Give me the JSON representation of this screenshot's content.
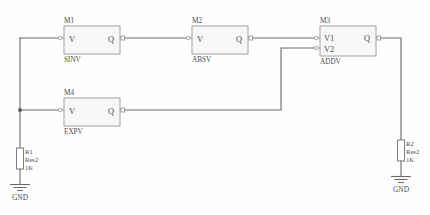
{
  "canvas": {
    "width": 430,
    "height": 215,
    "background": "#fefefe",
    "wire_color": "#6b6b6b",
    "block_fill": "#f7f7f7",
    "block_stroke": "#9a9a9a",
    "text_color": "#4a4a4a",
    "title": "Behavioral function block schematic"
  },
  "blocks": [
    {
      "id": "m1",
      "ref": "M1",
      "type": "SINV",
      "inputs": [
        "V"
      ],
      "output": "Q",
      "x": 64,
      "y": 26,
      "width": 56,
      "height": 28
    },
    {
      "id": "m2",
      "ref": "M2",
      "type": "ABSV",
      "inputs": [
        "V"
      ],
      "output": "Q",
      "x": 192,
      "y": 26,
      "width": 56,
      "height": 28
    },
    {
      "id": "m3",
      "ref": "M3",
      "type": "ADDV",
      "inputs": [
        "V1",
        "V2"
      ],
      "output": "Q",
      "x": 320,
      "y": 26,
      "width": 56,
      "height": 30
    },
    {
      "id": "m4",
      "ref": "M4",
      "type": "EXPV",
      "inputs": [
        "V"
      ],
      "output": "Q",
      "x": 64,
      "y": 98,
      "width": 56,
      "height": 28
    }
  ],
  "resistors": [
    {
      "id": "r1",
      "ref": "R1",
      "model": "Res2",
      "value": "1K",
      "x": 20,
      "y": 148,
      "ground": "GND"
    },
    {
      "id": "r2",
      "ref": "R2",
      "model": "Res2",
      "value": "1K",
      "x": 401,
      "y": 140,
      "ground": "GND"
    }
  ],
  "grounds": [
    {
      "id": "gnd1",
      "label": "GND"
    },
    {
      "id": "gnd2",
      "label": "GND"
    }
  ],
  "nets": [
    {
      "id": "net-source",
      "from": "R1 top node",
      "to": "M1.V and M4.V"
    },
    {
      "id": "net-m1-m2",
      "from": "M1.Q",
      "to": "M2.V"
    },
    {
      "id": "net-m2-m3v1",
      "from": "M2.Q",
      "to": "M3.V1"
    },
    {
      "id": "net-m4-m3v2",
      "from": "M4.Q",
      "to": "M3.V2"
    },
    {
      "id": "net-m3-r2",
      "from": "M3.Q",
      "to": "R2 top node"
    }
  ]
}
